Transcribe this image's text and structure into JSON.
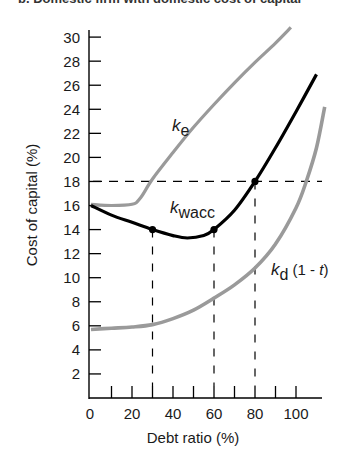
{
  "title_clipped": "b. Domestic firm with domestic cost of capital",
  "chart_data": {
    "type": "line",
    "title": "b. Domestic firm with domestic cost of capital",
    "xlabel": "Debt ratio (%)",
    "ylabel": "Cost of capital (%)",
    "xlim": [
      0,
      115
    ],
    "ylim": [
      0,
      31
    ],
    "x_ticks": [
      0,
      20,
      40,
      60,
      80,
      100
    ],
    "x_minor_ticks": [
      10,
      20,
      30,
      40,
      50,
      60,
      70,
      80,
      90,
      100
    ],
    "y_ticks": [
      2,
      4,
      6,
      8,
      10,
      12,
      14,
      16,
      18,
      20,
      22,
      24,
      26,
      28,
      30
    ],
    "grid": false,
    "series": [
      {
        "name": "k_e",
        "label": "k",
        "label_sub": "e",
        "color": "#9a9a9a",
        "x": [
          0,
          10,
          20,
          24,
          30,
          40,
          50,
          60,
          70,
          80,
          90,
          97.5
        ],
        "y": [
          16.1,
          16.0,
          16.1,
          16.6,
          18.2,
          20.4,
          22.5,
          24.4,
          26.2,
          27.9,
          29.5,
          30.8
        ]
      },
      {
        "name": "k_wacc",
        "label": "k",
        "label_sub": "wacc",
        "color": "#000000",
        "x": [
          0,
          10,
          20,
          30,
          40,
          47,
          55,
          60,
          70,
          80,
          90,
          100,
          110
        ],
        "y": [
          16.0,
          15.2,
          14.6,
          14.0,
          13.5,
          13.3,
          13.5,
          14.0,
          15.6,
          18.0,
          20.8,
          23.8,
          26.9
        ]
      },
      {
        "name": "k_d(1-t)",
        "label": "k",
        "label_sub": "d",
        "label_suffix": " (1 - ",
        "label_italic": "t",
        "label_end": ")",
        "color": "#9a9a9a",
        "x": [
          0,
          10,
          20,
          30,
          40,
          50,
          60,
          70,
          80,
          90,
          100,
          105,
          110,
          114
        ],
        "y": [
          5.7,
          5.8,
          5.9,
          6.1,
          6.6,
          7.3,
          8.3,
          9.4,
          10.8,
          12.8,
          15.8,
          18.0,
          20.8,
          24.2
        ]
      }
    ],
    "annotations": {
      "markers": [
        {
          "x": 30,
          "y": 14.0,
          "series": "k_wacc"
        },
        {
          "x": 60,
          "y": 14.0,
          "series": "k_wacc"
        },
        {
          "x": 80,
          "y": 18.0,
          "series": "k_wacc"
        }
      ],
      "horizontal_dashed": {
        "y": 18,
        "x_from": 0,
        "x_to": 112
      },
      "vertical_dashed": [
        {
          "x": 30,
          "y_from": 0,
          "y_to": 14.0
        },
        {
          "x": 60,
          "y_from": 0,
          "y_to": 14.0
        },
        {
          "x": 80,
          "y_from": 0,
          "y_to": 18.0
        }
      ]
    }
  }
}
